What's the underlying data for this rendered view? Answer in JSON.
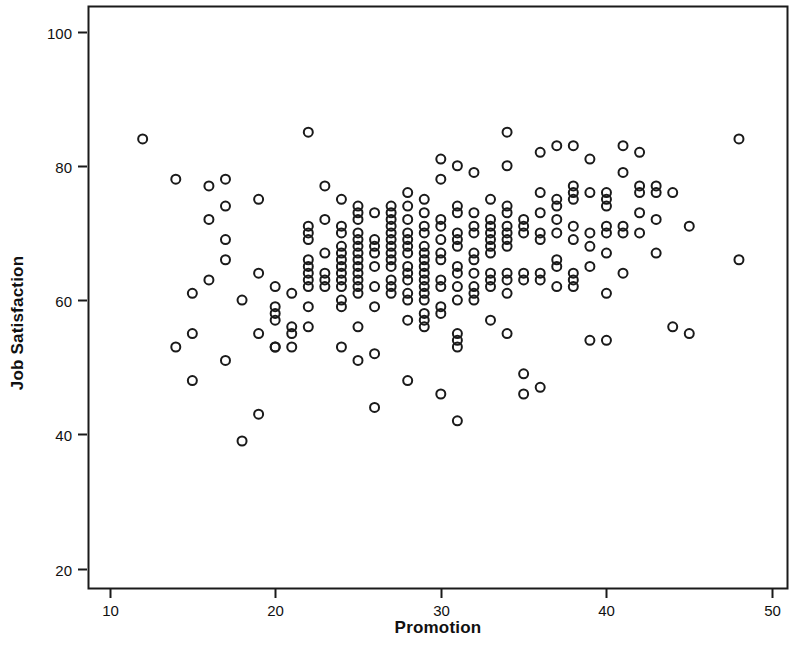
{
  "chart_data": {
    "type": "scatter",
    "title": "",
    "xlabel": "Promotion",
    "ylabel": "Job Satisfaction",
    "xlim": [
      8.7,
      50.9
    ],
    "ylim": [
      17.1,
      103.8
    ],
    "xticks": [
      10,
      20,
      30,
      40,
      50
    ],
    "yticks": [
      20,
      40,
      60,
      80,
      100
    ],
    "grid": false,
    "legend": null,
    "marker": {
      "shape": "open-circle",
      "fill": "none",
      "stroke": "#1a1a1a",
      "stroke_width": 2,
      "diameter_px": 9
    },
    "frame_color": "#1a1a1a",
    "background": "#ffffff",
    "points": [
      [
        12,
        84
      ],
      [
        14,
        78
      ],
      [
        14,
        53
      ],
      [
        15,
        61
      ],
      [
        15,
        55
      ],
      [
        15,
        48
      ],
      [
        16,
        77
      ],
      [
        16,
        72
      ],
      [
        16,
        63
      ],
      [
        17,
        78
      ],
      [
        17,
        74
      ],
      [
        17,
        69
      ],
      [
        17,
        66
      ],
      [
        17,
        51
      ],
      [
        18,
        60
      ],
      [
        18,
        39
      ],
      [
        19,
        75
      ],
      [
        19,
        64
      ],
      [
        19,
        55
      ],
      [
        19,
        43
      ],
      [
        20,
        62
      ],
      [
        20,
        59
      ],
      [
        20,
        58
      ],
      [
        20,
        57
      ],
      [
        20,
        53
      ],
      [
        20,
        53
      ],
      [
        21,
        61
      ],
      [
        21,
        56
      ],
      [
        21,
        55
      ],
      [
        21,
        53
      ],
      [
        22,
        85
      ],
      [
        22,
        71
      ],
      [
        22,
        70
      ],
      [
        22,
        69
      ],
      [
        22,
        66
      ],
      [
        22,
        65
      ],
      [
        22,
        64
      ],
      [
        22,
        63
      ],
      [
        22,
        62
      ],
      [
        22,
        59
      ],
      [
        22,
        56
      ],
      [
        23,
        77
      ],
      [
        23,
        72
      ],
      [
        23,
        67
      ],
      [
        23,
        64
      ],
      [
        23,
        63
      ],
      [
        23,
        62
      ],
      [
        24,
        75
      ],
      [
        24,
        71
      ],
      [
        24,
        70
      ],
      [
        24,
        68
      ],
      [
        24,
        67
      ],
      [
        24,
        66
      ],
      [
        24,
        65
      ],
      [
        24,
        64
      ],
      [
        24,
        63
      ],
      [
        24,
        62
      ],
      [
        24,
        60
      ],
      [
        24,
        59
      ],
      [
        24,
        53
      ],
      [
        25,
        74
      ],
      [
        25,
        73
      ],
      [
        25,
        72
      ],
      [
        25,
        70
      ],
      [
        25,
        69
      ],
      [
        25,
        68
      ],
      [
        25,
        67
      ],
      [
        25,
        66
      ],
      [
        25,
        65
      ],
      [
        25,
        64
      ],
      [
        25,
        63
      ],
      [
        25,
        62
      ],
      [
        25,
        61
      ],
      [
        25,
        56
      ],
      [
        25,
        51
      ],
      [
        26,
        73
      ],
      [
        26,
        69
      ],
      [
        26,
        68
      ],
      [
        26,
        67
      ],
      [
        26,
        65
      ],
      [
        26,
        62
      ],
      [
        26,
        59
      ],
      [
        26,
        52
      ],
      [
        26,
        44
      ],
      [
        27,
        74
      ],
      [
        27,
        73
      ],
      [
        27,
        72
      ],
      [
        27,
        71
      ],
      [
        27,
        70
      ],
      [
        27,
        69
      ],
      [
        27,
        68
      ],
      [
        27,
        67
      ],
      [
        27,
        66
      ],
      [
        27,
        65
      ],
      [
        27,
        63
      ],
      [
        27,
        62
      ],
      [
        27,
        61
      ],
      [
        28,
        76
      ],
      [
        28,
        74
      ],
      [
        28,
        72
      ],
      [
        28,
        70
      ],
      [
        28,
        69
      ],
      [
        28,
        68
      ],
      [
        28,
        67
      ],
      [
        28,
        65
      ],
      [
        28,
        64
      ],
      [
        28,
        63
      ],
      [
        28,
        61
      ],
      [
        28,
        60
      ],
      [
        28,
        57
      ],
      [
        28,
        48
      ],
      [
        29,
        75
      ],
      [
        29,
        73
      ],
      [
        29,
        71
      ],
      [
        29,
        70
      ],
      [
        29,
        68
      ],
      [
        29,
        67
      ],
      [
        29,
        66
      ],
      [
        29,
        65
      ],
      [
        29,
        64
      ],
      [
        29,
        63
      ],
      [
        29,
        62
      ],
      [
        29,
        61
      ],
      [
        29,
        60
      ],
      [
        29,
        58
      ],
      [
        29,
        57
      ],
      [
        29,
        56
      ],
      [
        30,
        81
      ],
      [
        30,
        78
      ],
      [
        30,
        72
      ],
      [
        30,
        71
      ],
      [
        30,
        69
      ],
      [
        30,
        67
      ],
      [
        30,
        66
      ],
      [
        30,
        63
      ],
      [
        30,
        62
      ],
      [
        30,
        59
      ],
      [
        30,
        58
      ],
      [
        30,
        46
      ],
      [
        31,
        80
      ],
      [
        31,
        74
      ],
      [
        31,
        73
      ],
      [
        31,
        70
      ],
      [
        31,
        69
      ],
      [
        31,
        68
      ],
      [
        31,
        65
      ],
      [
        31,
        64
      ],
      [
        31,
        62
      ],
      [
        31,
        60
      ],
      [
        31,
        55
      ],
      [
        31,
        54
      ],
      [
        31,
        53
      ],
      [
        31,
        42
      ],
      [
        32,
        79
      ],
      [
        32,
        73
      ],
      [
        32,
        71
      ],
      [
        32,
        70
      ],
      [
        32,
        67
      ],
      [
        32,
        66
      ],
      [
        32,
        64
      ],
      [
        32,
        62
      ],
      [
        32,
        61
      ],
      [
        32,
        60
      ],
      [
        33,
        75
      ],
      [
        33,
        72
      ],
      [
        33,
        71
      ],
      [
        33,
        70
      ],
      [
        33,
        69
      ],
      [
        33,
        68
      ],
      [
        33,
        67
      ],
      [
        33,
        64
      ],
      [
        33,
        63
      ],
      [
        33,
        62
      ],
      [
        33,
        57
      ],
      [
        34,
        85
      ],
      [
        34,
        80
      ],
      [
        34,
        74
      ],
      [
        34,
        73
      ],
      [
        34,
        71
      ],
      [
        34,
        70
      ],
      [
        34,
        69
      ],
      [
        34,
        68
      ],
      [
        34,
        64
      ],
      [
        34,
        63
      ],
      [
        34,
        61
      ],
      [
        34,
        55
      ],
      [
        35,
        72
      ],
      [
        35,
        71
      ],
      [
        35,
        70
      ],
      [
        35,
        64
      ],
      [
        35,
        63
      ],
      [
        35,
        49
      ],
      [
        35,
        46
      ],
      [
        36,
        82
      ],
      [
        36,
        76
      ],
      [
        36,
        73
      ],
      [
        36,
        70
      ],
      [
        36,
        69
      ],
      [
        36,
        64
      ],
      [
        36,
        63
      ],
      [
        36,
        47
      ],
      [
        37,
        83
      ],
      [
        37,
        75
      ],
      [
        37,
        74
      ],
      [
        37,
        72
      ],
      [
        37,
        70
      ],
      [
        37,
        66
      ],
      [
        37,
        65
      ],
      [
        37,
        62
      ],
      [
        38,
        83
      ],
      [
        38,
        77
      ],
      [
        38,
        76
      ],
      [
        38,
        75
      ],
      [
        38,
        71
      ],
      [
        38,
        69
      ],
      [
        38,
        64
      ],
      [
        38,
        63
      ],
      [
        38,
        62
      ],
      [
        39,
        81
      ],
      [
        39,
        76
      ],
      [
        39,
        70
      ],
      [
        39,
        68
      ],
      [
        39,
        65
      ],
      [
        39,
        54
      ],
      [
        40,
        76
      ],
      [
        40,
        75
      ],
      [
        40,
        74
      ],
      [
        40,
        71
      ],
      [
        40,
        70
      ],
      [
        40,
        67
      ],
      [
        40,
        61
      ],
      [
        40,
        54
      ],
      [
        41,
        83
      ],
      [
        41,
        79
      ],
      [
        41,
        71
      ],
      [
        41,
        70
      ],
      [
        41,
        64
      ],
      [
        42,
        82
      ],
      [
        42,
        77
      ],
      [
        42,
        76
      ],
      [
        42,
        73
      ],
      [
        42,
        70
      ],
      [
        43,
        77
      ],
      [
        43,
        76
      ],
      [
        43,
        72
      ],
      [
        43,
        67
      ],
      [
        44,
        76
      ],
      [
        44,
        56
      ],
      [
        45,
        71
      ],
      [
        45,
        55
      ],
      [
        48,
        84
      ],
      [
        48,
        66
      ]
    ]
  },
  "axes": {
    "x_tick_labels": [
      "10",
      "20",
      "30",
      "40",
      "50"
    ],
    "y_tick_labels": [
      "100",
      "80",
      "60",
      "40",
      "20"
    ],
    "x_axis_title": "Promotion",
    "y_axis_title": "Job Satisfaction"
  }
}
